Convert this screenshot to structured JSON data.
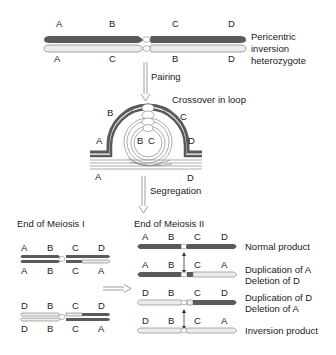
{
  "colors": {
    "dark": "#5a5a5a",
    "light": "#ececec",
    "outline": "#7a7a7a",
    "arrow": "#888888"
  },
  "top": {
    "upper_labels": [
      "A",
      "B",
      "C",
      "D"
    ],
    "lower_labels": [
      "A",
      "C",
      "B",
      "D"
    ],
    "caption_line1": "Pericentric",
    "caption_line2": "inversion",
    "caption_line3": "heterozygote"
  },
  "pairing_label": "Pairing",
  "loop": {
    "title": "Crossover in loop",
    "labels": {
      "a_top": "A",
      "b": "B",
      "c": "C",
      "d_top": "D",
      "inner_b": "B",
      "inner_c": "C",
      "a_bottom": "A",
      "d_bottom": "D"
    }
  },
  "segregation_label": "Segregation",
  "meiosis1": {
    "title": "End of Meiosis I",
    "pair1": {
      "upper": [
        "A",
        "B",
        "C",
        "D"
      ],
      "lower": [
        "A",
        "B",
        "C",
        "A"
      ]
    },
    "pair2": {
      "upper": [
        "D",
        "B",
        "C",
        "D"
      ],
      "lower": [
        "D",
        "B",
        "C",
        "A"
      ]
    }
  },
  "meiosis2": {
    "title": "End of Meiosis II",
    "products": [
      {
        "labels": [
          "A",
          "B",
          "C",
          "D"
        ],
        "desc1": "Normal product",
        "desc2": ""
      },
      {
        "labels": [
          "A",
          "B",
          "C",
          "A"
        ],
        "desc1": "Duplication of A",
        "desc2": "Deletion of D"
      },
      {
        "labels": [
          "D",
          "B",
          "C",
          "D"
        ],
        "desc1": "Duplication of D",
        "desc2": "Deletion of A"
      },
      {
        "labels": [
          "D",
          "B",
          "C",
          "A"
        ],
        "desc1": "Inversion product",
        "desc2": ""
      }
    ]
  }
}
